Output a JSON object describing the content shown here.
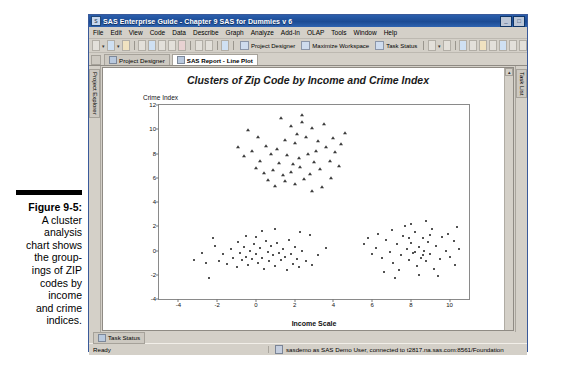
{
  "figure": {
    "label": "Figure 9-5:",
    "lines": [
      "A cluster",
      "analysis",
      "chart shows",
      "the group-",
      "ings of ZIP",
      "codes by",
      "income",
      "and crime",
      "indices."
    ]
  },
  "window": {
    "title": "SAS Enterprise Guide - Chapter 9 SAS for Dummies v 6",
    "icon": "sas-app-icon",
    "buttons": {
      "minimize": "_",
      "maximize": "□",
      "close": "✕"
    }
  },
  "menu": {
    "items": [
      "File",
      "Edit",
      "View",
      "Code",
      "Data",
      "Describe",
      "Graph",
      "Analyze",
      "Add-In",
      "OLAP",
      "Tools",
      "Window",
      "Help"
    ]
  },
  "toolbar": {
    "project_designer": "Project Designer",
    "maximize_workspace": "Maximize Workspace",
    "task_status": "Task Status"
  },
  "tabs": [
    {
      "label": "Project Designer",
      "active": false
    },
    {
      "label": "SAS Report - Line Plot",
      "active": true
    }
  ],
  "rails": {
    "left": "Project Explorer",
    "right": "Task List"
  },
  "bottom_tab": {
    "label": "Task Status"
  },
  "statusbar": {
    "left": "Ready",
    "connection": "sasdemo as SAS Demo User, connected to t2817.na.sas.com:8561/Foundation"
  },
  "chart_data": {
    "type": "scatter",
    "title": "Clusters of Zip Code by Income and Crime Index",
    "xlabel": "Income Scale",
    "ylabel": "Crime Index",
    "xlim": [
      -5,
      11
    ],
    "ylim": [
      -4,
      12
    ],
    "xticks": [
      -4,
      -2,
      0,
      2,
      4,
      6,
      8,
      10
    ],
    "yticks": [
      -4,
      -2,
      0,
      2,
      4,
      6,
      8,
      10,
      12
    ],
    "grid": false,
    "legend": "none",
    "series": [
      {
        "name": "Cluster 1 - high crime",
        "marker": "triangle",
        "color": "#3b3b3b",
        "points": [
          [
            1.1,
            8.4
          ],
          [
            1.5,
            9.1
          ],
          [
            1.8,
            10.3
          ],
          [
            2.1,
            9.6
          ],
          [
            2.4,
            10.6
          ],
          [
            2.0,
            8.9
          ],
          [
            2.6,
            9.4
          ],
          [
            2.9,
            10.1
          ],
          [
            3.2,
            9.0
          ],
          [
            3.5,
            10.4
          ],
          [
            3.1,
            8.2
          ],
          [
            2.7,
            8.0
          ],
          [
            2.2,
            7.6
          ],
          [
            1.9,
            7.1
          ],
          [
            1.6,
            7.9
          ],
          [
            1.2,
            7.2
          ],
          [
            0.8,
            8.0
          ],
          [
            0.5,
            8.6
          ],
          [
            0.2,
            7.4
          ],
          [
            -0.2,
            8.2
          ],
          [
            -0.6,
            7.8
          ],
          [
            -0.9,
            8.5
          ],
          [
            0.0,
            6.8
          ],
          [
            0.4,
            6.4
          ],
          [
            0.9,
            6.6
          ],
          [
            1.4,
            6.2
          ],
          [
            1.8,
            6.5
          ],
          [
            2.3,
            6.9
          ],
          [
            2.8,
            6.3
          ],
          [
            3.3,
            6.7
          ],
          [
            3.8,
            7.4
          ],
          [
            4.1,
            8.1
          ],
          [
            4.4,
            8.8
          ],
          [
            4.0,
            9.3
          ],
          [
            3.6,
            8.5
          ],
          [
            3.0,
            7.3
          ],
          [
            2.5,
            5.9
          ],
          [
            2.0,
            5.5
          ],
          [
            1.5,
            5.7
          ],
          [
            1.0,
            5.3
          ],
          [
            0.6,
            5.8
          ],
          [
            3.4,
            5.2
          ],
          [
            2.9,
            4.9
          ],
          [
            4.6,
            9.7
          ],
          [
            1.3,
            10.9
          ],
          [
            0.1,
            9.4
          ],
          [
            -0.4,
            9.9
          ],
          [
            3.9,
            6.0
          ],
          [
            4.3,
            7.0
          ],
          [
            2.4,
            11.2
          ]
        ]
      },
      {
        "name": "Cluster 2 - left low crime",
        "marker": "circle",
        "color": "#1a1a1a",
        "points": [
          [
            -3.2,
            -0.8
          ],
          [
            -2.4,
            -2.3
          ],
          [
            -2.1,
            0.4
          ],
          [
            -1.9,
            -0.9
          ],
          [
            -1.7,
            -0.3
          ],
          [
            -1.5,
            -1.1
          ],
          [
            -1.3,
            0.1
          ],
          [
            -1.2,
            -0.6
          ],
          [
            -1.0,
            -1.4
          ],
          [
            -0.9,
            0.7
          ],
          [
            -0.8,
            -0.2
          ],
          [
            -0.7,
            -0.8
          ],
          [
            -0.6,
            0.3
          ],
          [
            -0.5,
            -0.5
          ],
          [
            -0.4,
            -1.2
          ],
          [
            -0.3,
            0.0
          ],
          [
            -0.2,
            -0.7
          ],
          [
            -0.1,
            0.5
          ],
          [
            0.0,
            -0.3
          ],
          [
            0.1,
            -1.0
          ],
          [
            0.2,
            0.2
          ],
          [
            0.3,
            -0.6
          ],
          [
            0.4,
            -1.5
          ],
          [
            0.5,
            0.8
          ],
          [
            0.6,
            -0.1
          ],
          [
            0.7,
            -0.9
          ],
          [
            0.8,
            0.4
          ],
          [
            0.9,
            -0.4
          ],
          [
            1.0,
            -1.3
          ],
          [
            1.1,
            0.6
          ],
          [
            1.2,
            -0.2
          ],
          [
            1.3,
            -0.8
          ],
          [
            1.4,
            0.1
          ],
          [
            1.5,
            -0.5
          ],
          [
            1.6,
            -1.6
          ],
          [
            1.7,
            0.9
          ],
          [
            1.8,
            -0.3
          ],
          [
            1.9,
            -1.1
          ],
          [
            2.0,
            0.3
          ],
          [
            2.1,
            -0.7
          ],
          [
            2.2,
            -1.4
          ],
          [
            2.4,
            0.0
          ],
          [
            2.6,
            -0.9
          ],
          [
            2.8,
            1.3
          ],
          [
            2.3,
            1.5
          ],
          [
            1.0,
            1.8
          ],
          [
            0.3,
            1.6
          ],
          [
            -0.5,
            1.2
          ],
          [
            3.2,
            -0.4
          ],
          [
            3.6,
            0.2
          ],
          [
            -2.8,
            -0.2
          ],
          [
            -2.6,
            -1.0
          ],
          [
            -2.2,
            1.0
          ],
          [
            0.0,
            1.1
          ],
          [
            2.9,
            -1.2
          ]
        ]
      },
      {
        "name": "Cluster 3 - right low crime",
        "marker": "circle",
        "color": "#1a1a1a",
        "points": [
          [
            6.2,
            0.2
          ],
          [
            6.5,
            -0.6
          ],
          [
            6.7,
            0.9
          ],
          [
            6.9,
            -0.1
          ],
          [
            7.1,
            -1.0
          ],
          [
            7.3,
            0.5
          ],
          [
            7.5,
            -0.4
          ],
          [
            7.6,
            1.2
          ],
          [
            7.8,
            0.1
          ],
          [
            7.9,
            -0.8
          ],
          [
            8.0,
            0.6
          ],
          [
            8.1,
            -0.2
          ],
          [
            8.2,
            1.5
          ],
          [
            8.3,
            -1.3
          ],
          [
            8.4,
            0.3
          ],
          [
            8.5,
            -0.6
          ],
          [
            8.6,
            1.0
          ],
          [
            8.7,
            0.0
          ],
          [
            8.8,
            -0.9
          ],
          [
            8.9,
            0.7
          ],
          [
            9.0,
            -0.3
          ],
          [
            9.1,
            1.8
          ],
          [
            9.2,
            -1.5
          ],
          [
            9.3,
            0.4
          ],
          [
            9.5,
            -0.7
          ],
          [
            9.6,
            1.1
          ],
          [
            9.8,
            0.0
          ],
          [
            10.0,
            -0.5
          ],
          [
            10.2,
            0.8
          ],
          [
            10.4,
            1.9
          ],
          [
            6.0,
            -0.3
          ],
          [
            6.3,
            1.4
          ],
          [
            7.0,
            1.7
          ],
          [
            7.4,
            -1.6
          ],
          [
            7.7,
            2.0
          ],
          [
            8.0,
            2.2
          ],
          [
            8.4,
            -2.0
          ],
          [
            8.8,
            2.4
          ],
          [
            9.4,
            -2.1
          ],
          [
            9.9,
            1.4
          ],
          [
            6.6,
            -1.8
          ],
          [
            7.2,
            -2.3
          ],
          [
            10.3,
            -1.2
          ],
          [
            5.6,
            0.5
          ],
          [
            5.8,
            1.0
          ],
          [
            10.5,
            0.1
          ],
          [
            8.2,
            -0.1
          ],
          [
            8.6,
            -0.4
          ],
          [
            9.0,
            1.3
          ],
          [
            7.9,
            1.0
          ]
        ]
      }
    ]
  }
}
